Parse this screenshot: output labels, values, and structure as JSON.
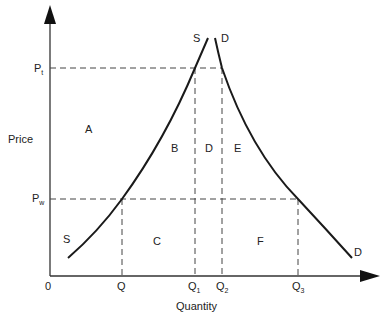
{
  "diagram": {
    "colors": {
      "ink": "#1a1a1a",
      "background": "#ffffff"
    },
    "axes": {
      "x_label": "Quantity",
      "y_label": "Price",
      "origin_label": "0"
    },
    "price_levels": [
      {
        "id": "pt",
        "base": "P",
        "sub": "t"
      },
      {
        "id": "pw",
        "base": "P",
        "sub": "w"
      }
    ],
    "quantity_levels": [
      {
        "id": "q",
        "base": "Q",
        "sub": ""
      },
      {
        "id": "q1",
        "base": "Q",
        "sub": "1"
      },
      {
        "id": "q2",
        "base": "Q",
        "sub": "2"
      },
      {
        "id": "q3",
        "base": "Q",
        "sub": "3"
      }
    ],
    "curves": {
      "supply": {
        "label_top": "S",
        "label_bottom": "S"
      },
      "demand": {
        "label_top": "D",
        "label_bottom": "D"
      }
    },
    "areas": [
      {
        "id": "a",
        "label": "A"
      },
      {
        "id": "b",
        "label": "B"
      },
      {
        "id": "c",
        "label": "C"
      },
      {
        "id": "d",
        "label": "D"
      },
      {
        "id": "e",
        "label": "E"
      },
      {
        "id": "f",
        "label": "F"
      }
    ]
  }
}
